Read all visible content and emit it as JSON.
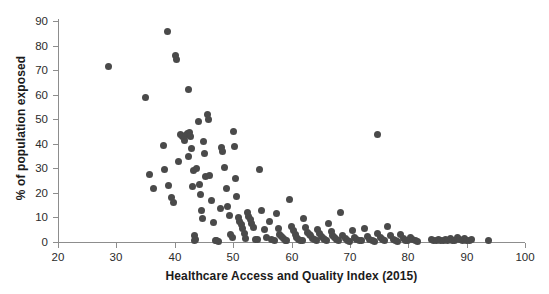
{
  "chart_data": {
    "type": "scatter",
    "title": "",
    "xlabel": "Healthcare Access and Quality Index (2015)",
    "ylabel": "% of population exposed",
    "xlim": [
      20,
      100
    ],
    "ylim": [
      0,
      90
    ],
    "xticks": [
      20,
      30,
      40,
      50,
      60,
      70,
      80,
      90,
      100
    ],
    "yticks": [
      0,
      10,
      20,
      30,
      40,
      50,
      60,
      70,
      80,
      90
    ],
    "grid": false,
    "legend": null,
    "marker": {
      "shape": "circle",
      "color": "#4a4a4a",
      "size_px": 7
    },
    "points": [
      [
        28.6,
        71.6
      ],
      [
        34.9,
        59.0
      ],
      [
        35.6,
        27.4
      ],
      [
        36.4,
        22.0
      ],
      [
        38.0,
        39.5
      ],
      [
        38.3,
        29.5
      ],
      [
        38.7,
        85.8
      ],
      [
        39.0,
        23.0
      ],
      [
        39.4,
        18.0
      ],
      [
        39.7,
        16.0
      ],
      [
        40.2,
        75.8
      ],
      [
        40.3,
        74.2
      ],
      [
        40.6,
        33.0
      ],
      [
        41.0,
        44.0
      ],
      [
        41.3,
        43.0
      ],
      [
        41.6,
        41.5
      ],
      [
        41.9,
        43.5
      ],
      [
        42.1,
        44.2
      ],
      [
        42.3,
        35.0
      ],
      [
        42.4,
        62.0
      ],
      [
        42.6,
        44.5
      ],
      [
        42.7,
        43.0
      ],
      [
        42.9,
        38.0
      ],
      [
        43.0,
        22.5
      ],
      [
        43.2,
        29.0
      ],
      [
        43.3,
        2.5
      ],
      [
        43.4,
        0.8
      ],
      [
        43.6,
        1.0
      ],
      [
        43.8,
        30.0
      ],
      [
        44.0,
        49.0
      ],
      [
        44.2,
        23.5
      ],
      [
        44.4,
        19.5
      ],
      [
        44.5,
        13.0
      ],
      [
        44.7,
        9.5
      ],
      [
        44.9,
        41.0
      ],
      [
        45.1,
        36.0
      ],
      [
        45.3,
        26.5
      ],
      [
        45.6,
        52.0
      ],
      [
        45.8,
        50.0
      ],
      [
        46.0,
        27.0
      ],
      [
        46.3,
        17.0
      ],
      [
        46.6,
        8.0
      ],
      [
        46.9,
        0.5
      ],
      [
        47.2,
        0.6
      ],
      [
        47.5,
        0.4
      ],
      [
        47.8,
        13.5
      ],
      [
        48.0,
        38.5
      ],
      [
        48.2,
        37.0
      ],
      [
        48.5,
        30.5
      ],
      [
        48.8,
        22.0
      ],
      [
        49.0,
        14.5
      ],
      [
        49.3,
        11.0
      ],
      [
        49.5,
        3.0
      ],
      [
        49.8,
        1.8
      ],
      [
        50.0,
        45.0
      ],
      [
        50.2,
        39.0
      ],
      [
        50.4,
        26.0
      ],
      [
        50.6,
        18.5
      ],
      [
        50.9,
        10.0
      ],
      [
        51.1,
        8.5
      ],
      [
        51.4,
        7.0
      ],
      [
        51.6,
        5.5
      ],
      [
        51.9,
        3.5
      ],
      [
        52.1,
        1.5
      ],
      [
        52.4,
        12.0
      ],
      [
        52.6,
        10.5
      ],
      [
        52.9,
        9.0
      ],
      [
        53.2,
        7.5
      ],
      [
        53.5,
        6.0
      ],
      [
        53.8,
        1.2
      ],
      [
        54.1,
        0.9
      ],
      [
        54.5,
        29.5
      ],
      [
        54.9,
        13.0
      ],
      [
        55.3,
        5.0
      ],
      [
        55.7,
        2.0
      ],
      [
        56.2,
        8.5
      ],
      [
        56.6,
        1.0
      ],
      [
        57.0,
        0.7
      ],
      [
        57.4,
        11.5
      ],
      [
        57.8,
        5.5
      ],
      [
        58.0,
        3.0
      ],
      [
        58.3,
        2.2
      ],
      [
        58.6,
        1.5
      ],
      [
        58.9,
        0.6
      ],
      [
        59.2,
        0.5
      ],
      [
        59.6,
        17.5
      ],
      [
        60.0,
        6.5
      ],
      [
        60.3,
        4.5
      ],
      [
        60.6,
        3.0
      ],
      [
        60.9,
        2.0
      ],
      [
        61.2,
        1.2
      ],
      [
        61.5,
        0.8
      ],
      [
        61.8,
        0.5
      ],
      [
        62.1,
        9.5
      ],
      [
        62.4,
        6.0
      ],
      [
        62.7,
        4.0
      ],
      [
        63.0,
        3.2
      ],
      [
        63.3,
        2.5
      ],
      [
        63.6,
        1.6
      ],
      [
        63.9,
        1.0
      ],
      [
        64.2,
        0.6
      ],
      [
        64.5,
        5.0
      ],
      [
        64.8,
        3.5
      ],
      [
        65.1,
        2.2
      ],
      [
        65.4,
        1.4
      ],
      [
        65.7,
        0.9
      ],
      [
        66.0,
        0.5
      ],
      [
        66.4,
        7.5
      ],
      [
        66.8,
        4.2
      ],
      [
        67.1,
        2.8
      ],
      [
        67.4,
        1.8
      ],
      [
        67.7,
        1.0
      ],
      [
        68.0,
        0.6
      ],
      [
        68.4,
        12.0
      ],
      [
        68.8,
        2.5
      ],
      [
        69.2,
        1.5
      ],
      [
        69.6,
        0.8
      ],
      [
        70.0,
        0.4
      ],
      [
        70.4,
        4.5
      ],
      [
        70.8,
        2.0
      ],
      [
        71.2,
        1.2
      ],
      [
        71.6,
        0.7
      ],
      [
        72.0,
        0.5
      ],
      [
        72.5,
        5.5
      ],
      [
        73.0,
        2.2
      ],
      [
        73.4,
        1.0
      ],
      [
        73.8,
        0.6
      ],
      [
        74.2,
        0.4
      ],
      [
        74.7,
        44.0
      ],
      [
        74.8,
        3.5
      ],
      [
        75.2,
        1.8
      ],
      [
        75.6,
        0.9
      ],
      [
        76.0,
        0.5
      ],
      [
        76.5,
        6.5
      ],
      [
        77.0,
        2.5
      ],
      [
        77.4,
        1.2
      ],
      [
        77.8,
        0.6
      ],
      [
        78.2,
        0.4
      ],
      [
        78.7,
        3.0
      ],
      [
        79.1,
        1.5
      ],
      [
        79.5,
        0.8
      ],
      [
        79.9,
        0.5
      ],
      [
        80.4,
        2.0
      ],
      [
        80.8,
        1.0
      ],
      [
        81.2,
        0.6
      ],
      [
        81.6,
        0.4
      ],
      [
        84.0,
        0.9
      ],
      [
        84.4,
        0.6
      ],
      [
        84.8,
        0.5
      ],
      [
        85.2,
        1.2
      ],
      [
        85.6,
        0.7
      ],
      [
        86.0,
        0.5
      ],
      [
        86.4,
        1.0
      ],
      [
        86.8,
        0.6
      ],
      [
        87.2,
        1.5
      ],
      [
        87.6,
        0.8
      ],
      [
        88.0,
        0.5
      ],
      [
        88.4,
        2.0
      ],
      [
        88.8,
        1.0
      ],
      [
        89.2,
        0.6
      ],
      [
        89.6,
        1.3
      ],
      [
        90.0,
        0.7
      ],
      [
        90.4,
        0.5
      ],
      [
        90.8,
        0.9
      ],
      [
        93.8,
        0.6
      ]
    ]
  }
}
